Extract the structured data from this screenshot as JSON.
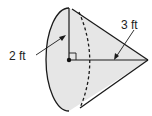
{
  "diagram": {
    "shape": "cone",
    "labels": {
      "radius": "2 ft",
      "height": "3 ft"
    },
    "colors": {
      "fill": "#e6e6e6",
      "stroke": "#1a1a1a"
    }
  }
}
